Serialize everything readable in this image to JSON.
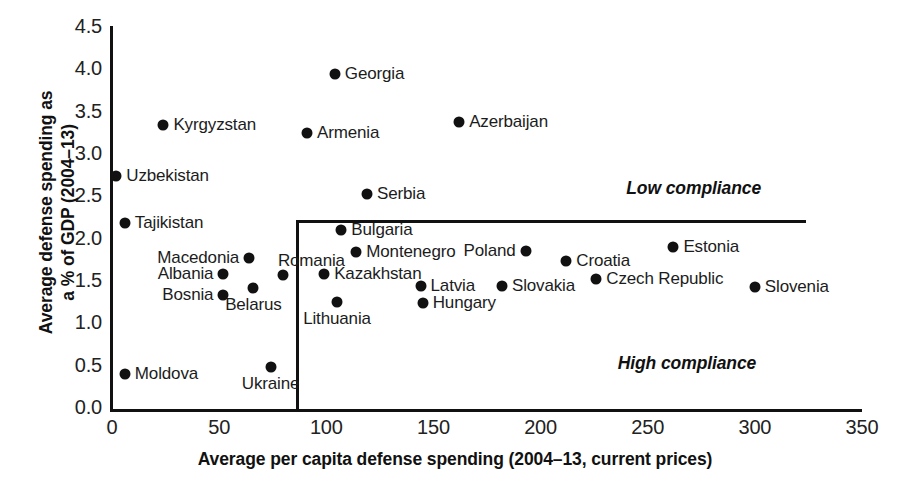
{
  "chart_data": {
    "type": "scatter",
    "title": "",
    "xlabel": "Average per capita defense spending (2004–13, current prices)",
    "ylabel": "Average defense spending as a % of GDP (2004–13)",
    "ylabel_line1": "Average defense spending as",
    "ylabel_line2": "a % of GDP (2004–13)",
    "xlim": [
      0,
      350
    ],
    "ylim": [
      0.0,
      4.5
    ],
    "xticks": [
      "0",
      "50",
      "100",
      "150",
      "200",
      "250",
      "300",
      "350"
    ],
    "xtick_values": [
      0,
      50,
      100,
      150,
      200,
      250,
      300,
      350
    ],
    "yticks": [
      "0.0",
      "0.5",
      "1.0",
      "1.5",
      "2.0",
      "2.5",
      "3.0",
      "3.5",
      "4.0",
      "4.5"
    ],
    "ytick_values": [
      0.0,
      0.5,
      1.0,
      1.5,
      2.0,
      2.5,
      3.0,
      3.5,
      4.0,
      4.5
    ],
    "grid": false,
    "legend": "none",
    "marker_color": "#111111",
    "axis_color": "#111111",
    "threshold_lines": {
      "vertical_x": 86,
      "horizontal_y": 2.23,
      "horizontal_x_end": 324
    },
    "annotations": [
      {
        "text": "Low compliance",
        "x": 240,
        "y": 2.6
      },
      {
        "text": "High compliance",
        "x": 236,
        "y": 0.53
      }
    ],
    "points": [
      {
        "label": "Georgia",
        "x": 104,
        "y": 3.96,
        "label_side": "right"
      },
      {
        "label": "Kyrgyzstan",
        "x": 24,
        "y": 3.35,
        "label_side": "right"
      },
      {
        "label": "Azerbaijan",
        "x": 162,
        "y": 3.39,
        "label_side": "right"
      },
      {
        "label": "Armenia",
        "x": 91,
        "y": 3.26,
        "label_side": "right"
      },
      {
        "label": "Uzbekistan",
        "x": 2,
        "y": 2.75,
        "label_side": "right"
      },
      {
        "label": "Serbia",
        "x": 119,
        "y": 2.54,
        "label_side": "right"
      },
      {
        "label": "Tajikistan",
        "x": 6,
        "y": 2.2,
        "label_side": "right"
      },
      {
        "label": "Bulgaria",
        "x": 107,
        "y": 2.11,
        "label_side": "right"
      },
      {
        "label": "Estonia",
        "x": 262,
        "y": 1.91,
        "label_side": "right"
      },
      {
        "label": "Poland",
        "x": 193,
        "y": 1.87,
        "label_side": "left"
      },
      {
        "label": "Montenegro",
        "x": 114,
        "y": 1.86,
        "label_side": "right"
      },
      {
        "label": "Macedonia",
        "x": 64,
        "y": 1.78,
        "label_side": "left"
      },
      {
        "label": "Croatia",
        "x": 212,
        "y": 1.75,
        "label_side": "right"
      },
      {
        "label": "Albania",
        "x": 52,
        "y": 1.6,
        "label_side": "left"
      },
      {
        "label": "Romania",
        "x": 80,
        "y": 1.58,
        "label_side": "center-above"
      },
      {
        "label": "Kazakhstan",
        "x": 99,
        "y": 1.6,
        "label_side": "right"
      },
      {
        "label": "Czech Republic",
        "x": 226,
        "y": 1.53,
        "label_side": "right"
      },
      {
        "label": "Latvia",
        "x": 144,
        "y": 1.45,
        "label_side": "right"
      },
      {
        "label": "Slovakia",
        "x": 182,
        "y": 1.45,
        "label_side": "right"
      },
      {
        "label": "Slovenia",
        "x": 300,
        "y": 1.44,
        "label_side": "right"
      },
      {
        "label": "Belarus",
        "x": 66,
        "y": 1.43,
        "label_side": "center-below"
      },
      {
        "label": "Bosnia",
        "x": 52,
        "y": 1.35,
        "label_side": "left"
      },
      {
        "label": "Lithuania",
        "x": 105,
        "y": 1.26,
        "label_side": "center-below"
      },
      {
        "label": "Hungary",
        "x": 145,
        "y": 1.25,
        "label_side": "right"
      },
      {
        "label": "Ukraine",
        "x": 74,
        "y": 0.5,
        "label_side": "center-below"
      },
      {
        "label": "Moldova",
        "x": 6,
        "y": 0.41,
        "label_side": "right"
      }
    ]
  }
}
